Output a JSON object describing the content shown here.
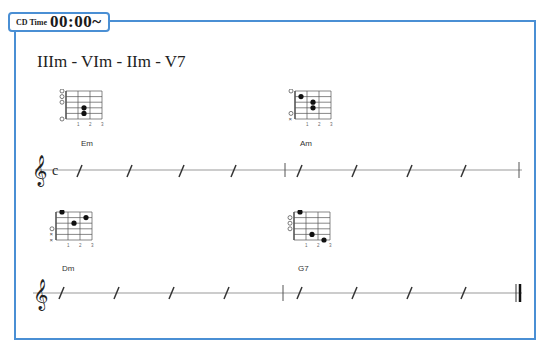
{
  "header": {
    "cd_label": "CD Time",
    "cd_time": "00:00~"
  },
  "progression": "IIIm - VIm - IIm - V7",
  "accent_color": "#4a8fd4",
  "chords": [
    {
      "name": "Em",
      "strings_top_to_bottom": [
        "1",
        "2",
        "3",
        "4",
        "5",
        "6"
      ],
      "open_markers": [
        "O",
        "O",
        "O",
        "",
        "",
        "O"
      ],
      "dots": [
        {
          "string": 4,
          "fret": 2
        },
        {
          "string": 5,
          "fret": 2
        }
      ],
      "fret_numbers": [
        "1",
        "2",
        "3"
      ]
    },
    {
      "name": "Am",
      "open_markers": [
        "O",
        "",
        "",
        "",
        "O",
        "X"
      ],
      "dots": [
        {
          "string": 2,
          "fret": 1
        },
        {
          "string": 3,
          "fret": 2
        },
        {
          "string": 4,
          "fret": 2
        }
      ],
      "fret_numbers": [
        "1",
        "2",
        "3"
      ]
    },
    {
      "name": "Dm",
      "open_markers": [
        "",
        "",
        "",
        "O",
        "X",
        "X"
      ],
      "dots": [
        {
          "string": 1,
          "fret": 1
        },
        {
          "string": 3,
          "fret": 2
        },
        {
          "string": 2,
          "fret": 3
        }
      ],
      "fret_numbers": [
        "1",
        "2",
        "3"
      ]
    },
    {
      "name": "G7",
      "open_markers": [
        "",
        "O",
        "O",
        "O",
        "",
        ""
      ],
      "dots": [
        {
          "string": 1,
          "fret": 1
        },
        {
          "string": 5,
          "fret": 2
        },
        {
          "string": 6,
          "fret": 3
        }
      ],
      "fret_numbers": [
        "1",
        "2",
        "3"
      ]
    }
  ],
  "staves": [
    {
      "time_signature": "c",
      "clef": "treble",
      "measures": 2,
      "beats_per_measure": 4,
      "end": "single"
    },
    {
      "time_signature": "",
      "clef": "treble",
      "measures": 2,
      "beats_per_measure": 4,
      "end": "final"
    }
  ]
}
